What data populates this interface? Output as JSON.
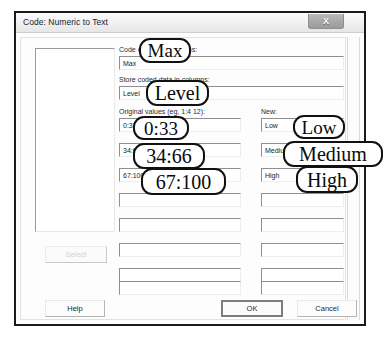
{
  "window": {
    "title": "Code: Numeric to Text",
    "close_icon": "close-x-icon",
    "close_glyph": "X"
  },
  "form": {
    "code_from_label": "Code data from columns:",
    "code_from_value": "Max",
    "store_in_label": "Store coded data in columns:",
    "store_in_value": "Level",
    "original_header": "Original values (eg, 1:4 12):",
    "new_header": "New:",
    "select_label": "Select",
    "rows": [
      {
        "original": "0:33",
        "new": "Low"
      },
      {
        "original": "34:66",
        "new": "Medium"
      },
      {
        "original": "67:100",
        "new": "High"
      },
      {
        "original": "",
        "new": ""
      },
      {
        "original": "",
        "new": ""
      },
      {
        "original": "",
        "new": ""
      },
      {
        "original": "",
        "new": ""
      },
      {
        "original": "",
        "new": ""
      }
    ]
  },
  "buttons": {
    "help": "Help",
    "ok": "OK",
    "cancel": "Cancel"
  },
  "annotations": [
    {
      "id": "co-max",
      "text": "Max"
    },
    {
      "id": "co-level",
      "text": "Level"
    },
    {
      "id": "co-033",
      "text": "0:33"
    },
    {
      "id": "co-3466",
      "text": "34:66"
    },
    {
      "id": "co-67100",
      "text": "67:100"
    },
    {
      "id": "co-low",
      "text": "Low"
    },
    {
      "id": "co-medium",
      "text": "Medium"
    },
    {
      "id": "co-high",
      "text": "High"
    }
  ],
  "colors": {
    "annotation_outline": "#111111",
    "frame": "#1a1a1a",
    "dialog_bg": "#fdfdfd",
    "disabled_text": "#d2d2d2"
  }
}
